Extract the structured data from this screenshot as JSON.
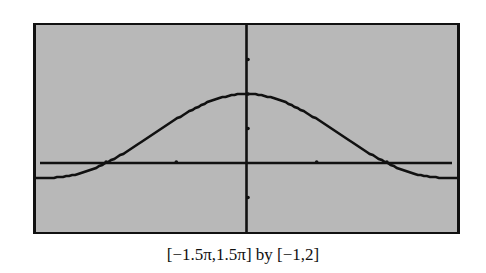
{
  "chart_data": {
    "type": "line",
    "title": "",
    "caption": "[−1.5π,1.5π] by [−1,2]",
    "xlabel": "",
    "ylabel": "",
    "xlim": [
      -4.712,
      4.712
    ],
    "ylim": [
      -1,
      2
    ],
    "x_tick_step": 1.5708,
    "y_tick_step": 0.5,
    "grid": false,
    "legend": null,
    "series": [
      {
        "name": "y = sin(x)/x",
        "x": [
          -4.712,
          -4.2,
          -3.6,
          -3.1416,
          -2.6,
          -2.0,
          -1.5,
          -1.0,
          -0.5,
          0,
          0.5,
          1.0,
          1.5,
          2.0,
          2.6,
          3.1416,
          3.6,
          4.2,
          4.712
        ],
        "values": [
          -0.212,
          -0.207,
          -0.123,
          0.0,
          0.198,
          0.455,
          0.665,
          0.841,
          0.959,
          1.0,
          0.959,
          0.841,
          0.665,
          0.455,
          0.198,
          0.0,
          -0.123,
          -0.207,
          -0.212
        ]
      }
    ],
    "colors": {
      "background": "#b8b8b8",
      "line": "#111111",
      "frame": "#111111"
    }
  }
}
